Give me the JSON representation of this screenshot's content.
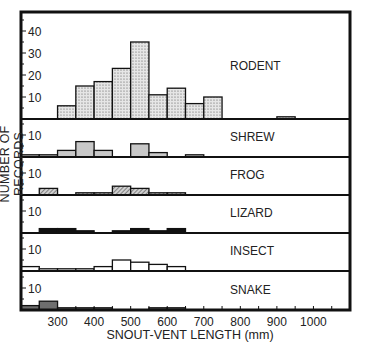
{
  "chart_data": {
    "type": "bar",
    "subtype": "stacked-panel histograms",
    "xlabel": "SNOUT-VENT LENGTH (mm)",
    "ylabel": "NUMBER OF RECORDS",
    "x_ticks": [
      300,
      400,
      500,
      600,
      700,
      800,
      900,
      1000
    ],
    "x_range": [
      200,
      1100
    ],
    "bin_width": 50,
    "grid": false,
    "panels": [
      {
        "name": "RODENT",
        "fill": "stipple",
        "y_ticks": [
          10,
          20,
          30,
          40
        ],
        "ylim": [
          0,
          45
        ],
        "bins": [
          300,
          350,
          400,
          450,
          500,
          550,
          600,
          650,
          700,
          900
        ],
        "values": [
          6,
          15,
          17,
          23,
          35,
          11,
          14,
          7,
          10,
          1
        ]
      },
      {
        "name": "SHREW",
        "fill": "light-gray",
        "y_ticks": [
          10
        ],
        "ylim": [
          0,
          15
        ],
        "bins": [
          200,
          250,
          300,
          350,
          400,
          500,
          550,
          650
        ],
        "values": [
          1,
          1,
          3,
          7,
          3,
          6,
          2,
          1
        ]
      },
      {
        "name": "FROG",
        "fill": "hatched",
        "y_ticks": [
          10
        ],
        "ylim": [
          0,
          15
        ],
        "bins": [
          250,
          350,
          400,
          450,
          500,
          550,
          600
        ],
        "values": [
          3,
          1,
          1,
          4,
          3,
          1,
          1
        ]
      },
      {
        "name": "LIZARD",
        "fill": "black",
        "y_ticks": [
          10
        ],
        "ylim": [
          0,
          15
        ],
        "bins": [
          250,
          300,
          350,
          450,
          500,
          550,
          600
        ],
        "values": [
          2,
          2,
          1,
          1,
          2,
          1,
          2
        ]
      },
      {
        "name": "INSECT",
        "fill": "white",
        "y_ticks": [
          10
        ],
        "ylim": [
          0,
          15
        ],
        "bins": [
          200,
          250,
          300,
          350,
          400,
          450,
          500,
          550,
          600
        ],
        "values": [
          2,
          1,
          1,
          1,
          2,
          5,
          4,
          3,
          2
        ]
      },
      {
        "name": "SNAKE",
        "fill": "dark-gray",
        "y_ticks": [
          10
        ],
        "ylim": [
          0,
          15
        ],
        "bins": [
          200,
          250,
          300,
          350,
          400,
          550,
          600
        ],
        "values": [
          2,
          4,
          1,
          1,
          1,
          1,
          1
        ]
      }
    ]
  },
  "labels": {
    "xlabel": "SNOUT-VENT LENGTH (mm)",
    "ylabel": "NUMBER OF RECORDS"
  }
}
